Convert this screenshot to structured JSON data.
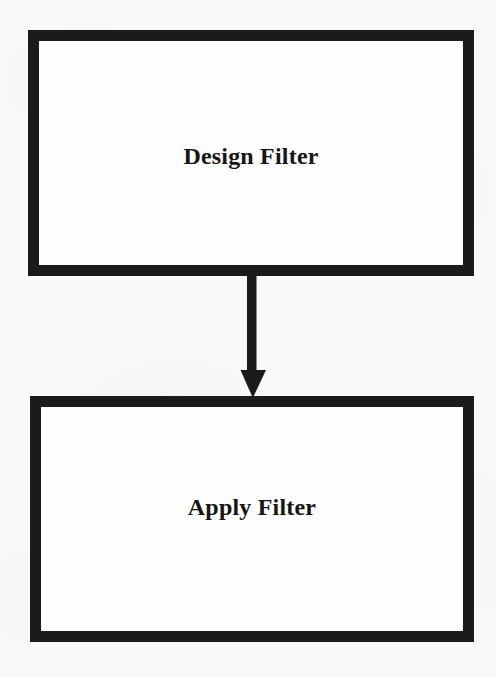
{
  "diagram": {
    "type": "flowchart",
    "orientation": "vertical",
    "background_color": "#f8f8f8",
    "stroke_color": "#1b1b1b",
    "fill_color": "#fdfdfd",
    "nodes": [
      {
        "id": "design-filter",
        "label": "Design Filter",
        "shape": "rectangle",
        "border_width_px": 11
      },
      {
        "id": "apply-filter",
        "label": "Apply Filter",
        "shape": "rectangle",
        "border_width_px": 11
      }
    ],
    "edges": [
      {
        "id": "design-to-apply",
        "from": "design-filter",
        "to": "apply-filter",
        "arrowhead": "solid-triangle",
        "direction": "down",
        "label": ""
      }
    ]
  }
}
